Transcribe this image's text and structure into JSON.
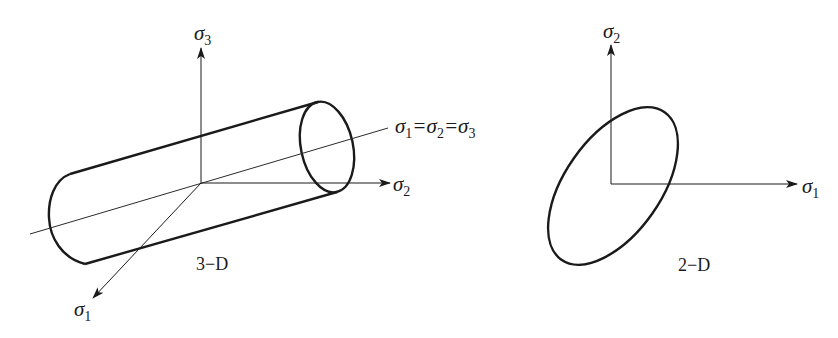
{
  "figure": {
    "panels": [
      {
        "id": "3d",
        "caption": "3−D",
        "axes": [
          {
            "symbol": "σ",
            "subscript": "3",
            "direction": "up"
          },
          {
            "symbol": "σ",
            "subscript": "2",
            "direction": "right"
          },
          {
            "symbol": "σ",
            "subscript": "1",
            "direction": "down-left"
          }
        ],
        "hydrostatic_line_label": {
          "parts": [
            "σ",
            "1",
            "=σ",
            "2",
            "=σ",
            "3"
          ]
        },
        "surface": "cylinder"
      },
      {
        "id": "2d",
        "caption": "2−D",
        "axes": [
          {
            "symbol": "σ",
            "subscript": "2",
            "direction": "up"
          },
          {
            "symbol": "σ",
            "subscript": "1",
            "direction": "right"
          }
        ],
        "surface": "ellipse"
      }
    ]
  }
}
